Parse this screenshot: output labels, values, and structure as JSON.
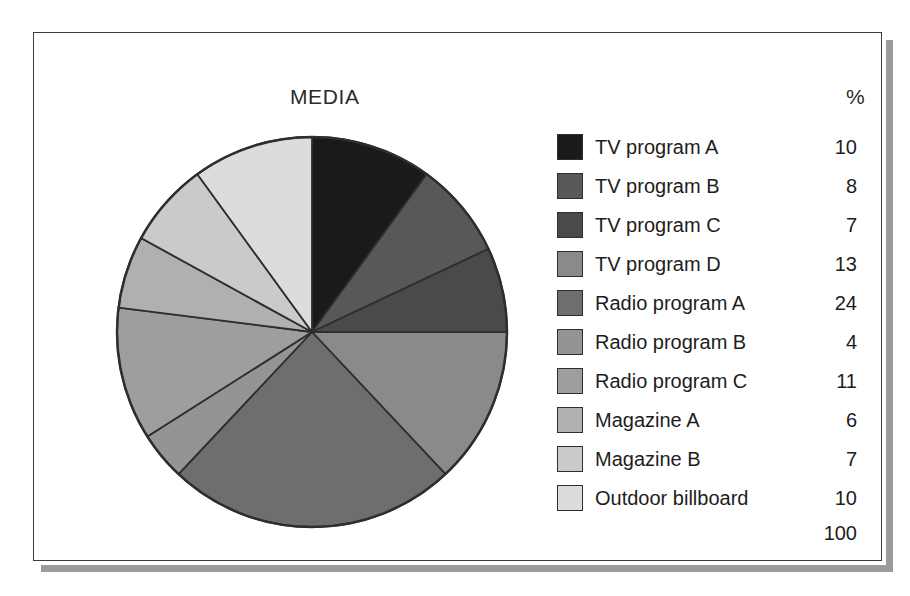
{
  "chart_data": {
    "type": "pie",
    "title": "MEDIA",
    "value_header": "%",
    "categories": [
      "TV program A",
      "TV program B",
      "TV program C",
      "TV program D",
      "Radio program A",
      "Radio program B",
      "Radio program C",
      "Magazine A",
      "Magazine B",
      "Outdoor billboard"
    ],
    "values": [
      10,
      8,
      7,
      13,
      24,
      4,
      11,
      6,
      7,
      10
    ],
    "colors": [
      "#1a1a1a",
      "#585858",
      "#4a4a4a",
      "#8a8a8a",
      "#6e6e6e",
      "#949494",
      "#9e9e9e",
      "#b0b0b0",
      "#cacaca",
      "#dcdcdc"
    ],
    "total": 100,
    "total_label": "100",
    "units": "percent",
    "start_angle_deg": 0,
    "direction": "clockwise",
    "legend_position": "right",
    "grid": false,
    "xlabel": "",
    "ylabel": ""
  },
  "header": {
    "title": "MEDIA",
    "percent_symbol": "%"
  },
  "legend": {
    "rows": [
      {
        "label": "TV program A",
        "value": "10",
        "color": "#1a1a1a"
      },
      {
        "label": "TV program B",
        "value": "8",
        "color": "#585858"
      },
      {
        "label": "TV program C",
        "value": "7",
        "color": "#4a4a4a"
      },
      {
        "label": "TV program D",
        "value": "13",
        "color": "#8a8a8a"
      },
      {
        "label": "Radio program A",
        "value": "24",
        "color": "#6e6e6e"
      },
      {
        "label": "Radio program B",
        "value": "4",
        "color": "#949494"
      },
      {
        "label": "Radio program C",
        "value": "11",
        "color": "#9e9e9e"
      },
      {
        "label": "Magazine A",
        "value": "6",
        "color": "#b0b0b0"
      },
      {
        "label": "Magazine B",
        "value": "7",
        "color": "#cacaca"
      },
      {
        "label": "Outdoor billboard",
        "value": "10",
        "color": "#dcdcdc"
      }
    ],
    "total": "100"
  }
}
